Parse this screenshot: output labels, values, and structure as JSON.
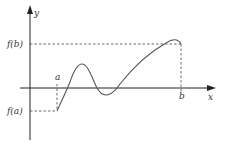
{
  "diagram": {
    "title": "",
    "labels": {
      "y_axis": "y",
      "x_axis": "x",
      "f_b": "f(b)",
      "f_a": "f(a)",
      "a": "a",
      "b": "b"
    },
    "colors": {
      "axis": "#222222",
      "curve": "#555555",
      "dashed": "#444444"
    },
    "points": {
      "a": {
        "x": 57,
        "y": 111
      },
      "b": {
        "x": 181,
        "y": 44
      }
    }
  }
}
